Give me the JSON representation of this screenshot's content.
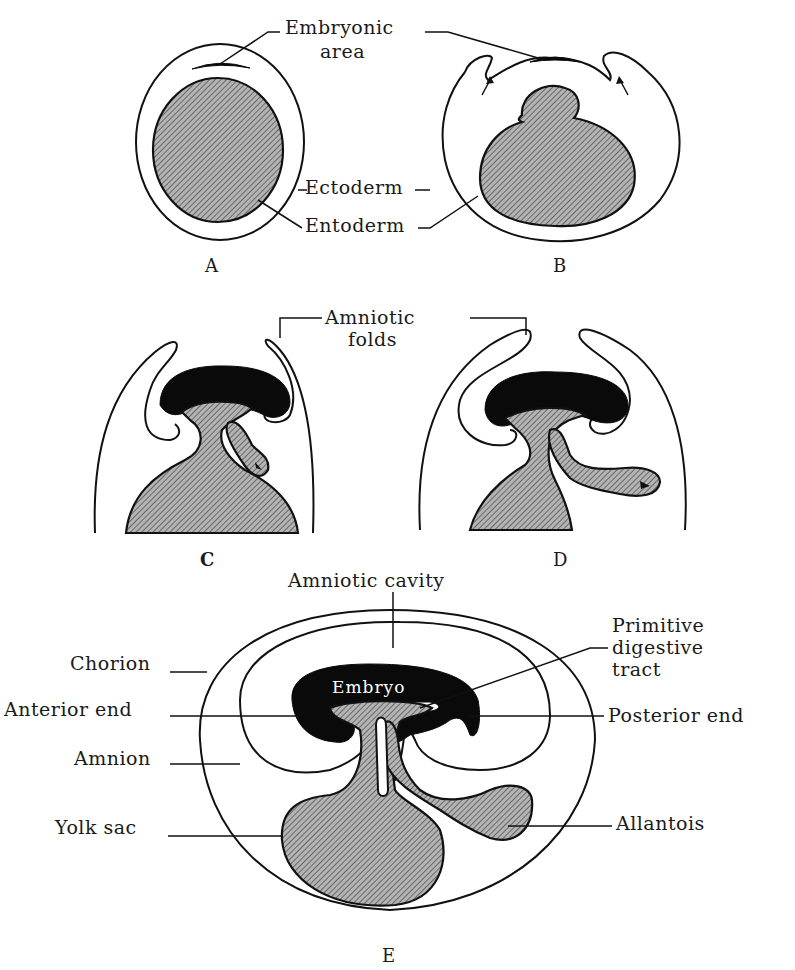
{
  "figure": {
    "colors": {
      "ink": "#111111",
      "fill_hatch": "#9a9a9a",
      "background": "#ffffff",
      "embryo": "#0a0a0a"
    },
    "panels": [
      {
        "id": "A",
        "label": "A"
      },
      {
        "id": "B",
        "label": "B"
      },
      {
        "id": "C",
        "label": "C"
      },
      {
        "id": "D",
        "label": "D"
      },
      {
        "id": "E",
        "label": "E"
      }
    ],
    "labels": {
      "embryonic_area_1": "Embryonic",
      "embryonic_area_2": "area",
      "ectoderm": "Ectoderm",
      "entoderm": "Entoderm",
      "amniotic_folds_1": "Amniotic",
      "amniotic_folds_2": "folds",
      "amniotic_cavity": "Amniotic cavity",
      "primitive_digestive_tract_1": "Primitive",
      "primitive_digestive_tract_2": "digestive",
      "primitive_digestive_tract_3": "tract",
      "chorion": "Chorion",
      "anterior_end": "Anterior end",
      "posterior_end": "Posterior end",
      "amnion": "Amnion",
      "yolk_sac": "Yolk sac",
      "allantois": "Allantois",
      "embryo": "Embryo"
    }
  }
}
